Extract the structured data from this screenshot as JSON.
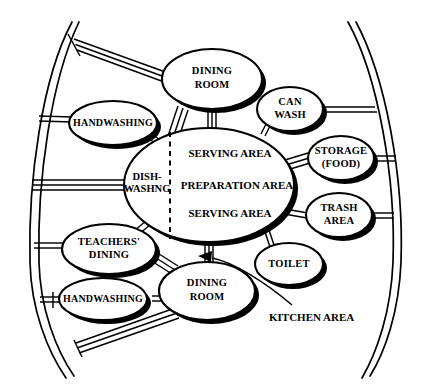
{
  "diagram": {
    "caption": "KITCHEN AREA",
    "colors": {
      "ink": "#000000",
      "paper": "#ffffff"
    },
    "central_node": {
      "name": "central-kitchen-ellipse",
      "left_label_line1": "DISH-",
      "left_label_line2": "WASHNG",
      "right_labels": [
        "SERVING AREA",
        "PREPARATION AREA",
        "SERVING AREA"
      ]
    },
    "nodes": [
      {
        "id": "dining-room-top",
        "lines": [
          "DINING",
          "ROOM"
        ]
      },
      {
        "id": "handwashing-upper",
        "lines": [
          "HANDWASHING"
        ]
      },
      {
        "id": "can-wash",
        "lines": [
          "CAN",
          "WASH"
        ]
      },
      {
        "id": "storage-food",
        "lines": [
          "STORAGE",
          "(FOOD)"
        ]
      },
      {
        "id": "trash-area",
        "lines": [
          "TRASH",
          "AREA"
        ]
      },
      {
        "id": "toilet",
        "lines": [
          "TOILET"
        ]
      },
      {
        "id": "teachers-dining",
        "lines": [
          "TEACHERS'",
          "DINING"
        ]
      },
      {
        "id": "handwashing-lower",
        "lines": [
          "HANDWASHING"
        ]
      },
      {
        "id": "dining-room-bottom",
        "lines": [
          "DINING",
          "ROOM"
        ]
      }
    ]
  }
}
